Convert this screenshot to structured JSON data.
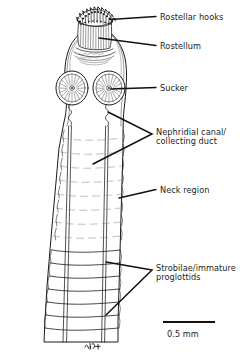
{
  "figure": {
    "artist_signature": "AGH",
    "background_color": "#ffffff",
    "ink_color": "#1a1a1a"
  },
  "labels": {
    "rostellar_hooks": "Rostellar hooks",
    "rostellum": "Rostellum",
    "sucker": "Sucker",
    "nephridial_canal": "Nephridial canal/\ncollecting duct",
    "neck_region": "Neck region",
    "strobilae": "Strobilae/immature\nproglottids"
  },
  "scale_bar": {
    "label": "0.5 mm",
    "length_px": 52
  },
  "anatomy": {
    "parts": [
      "rostellar-hooks-crown",
      "rostellum",
      "sucker-left",
      "sucker-right",
      "nephridial-canal-left",
      "nephridial-canal-right",
      "neck-region",
      "strobilae-segments"
    ],
    "sucker_count": 2,
    "nephridial_canal_count": 2
  }
}
